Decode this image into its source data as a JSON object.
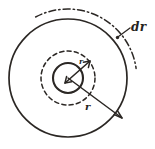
{
  "figure": {
    "type": "technical-line-drawing",
    "background_color": "#ffffff",
    "ink_color": "#2b2724",
    "canvas": {
      "width": 155,
      "height": 149
    },
    "labels": {
      "dr": "dr",
      "radius": "r",
      "inner_radius": "r"
    },
    "geometry": {
      "center": {
        "x": 68,
        "y": 78
      },
      "outer_circle": {
        "radius": 59,
        "style": "solid"
      },
      "dashdot_arc": {
        "radius": 69,
        "style": "dash-dot",
        "start_angle_deg": -118,
        "end_angle_deg": -8
      },
      "dashed_circle": {
        "radius": 27,
        "style": "dashed"
      },
      "inner_circle": {
        "radius": 15,
        "style": "solid"
      },
      "radius_arrow": {
        "from": {
          "x": 68,
          "y": 78
        },
        "to": {
          "x": 122,
          "y": 118
        },
        "label": "r"
      },
      "inner_arrow": {
        "from": {
          "x": 66,
          "y": 82
        },
        "to": {
          "x": 89,
          "y": 62
        },
        "double_headed": true
      },
      "dr_leader": {
        "from": {
          "x": 131,
          "y": 27
        },
        "to": {
          "x": 117,
          "y": 38
        }
      }
    }
  }
}
